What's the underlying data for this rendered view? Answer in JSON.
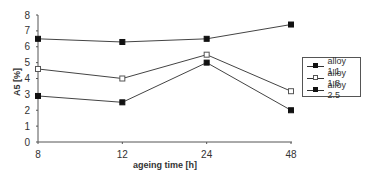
{
  "chart_data": {
    "type": "line",
    "title": "",
    "xlabel": "ageing time [h]",
    "ylabel": "A5 [%]",
    "categories": [
      "8",
      "12",
      "24",
      "48"
    ],
    "ylim": [
      0,
      8
    ],
    "yticks": [
      "0",
      "1",
      "2",
      "3",
      "4",
      "5",
      "6",
      "7",
      "8"
    ],
    "grid": false,
    "legend_position": "right",
    "series": [
      {
        "name": "alloy 1.1",
        "values": [
          6.5,
          6.3,
          6.5,
          7.4
        ],
        "marker": "filled-square",
        "color": "#111111"
      },
      {
        "name": "alloy 1.8",
        "values": [
          4.6,
          4.0,
          5.5,
          3.2
        ],
        "marker": "open-square",
        "color": "#555555"
      },
      {
        "name": "alloy 2.5",
        "values": [
          2.9,
          2.5,
          5.0,
          2.0
        ],
        "marker": "filled-square",
        "color": "#111111"
      }
    ]
  },
  "legend": {
    "items": [
      {
        "label": "alloy 1.1"
      },
      {
        "label": "alloy 1.8"
      },
      {
        "label": "alloy 2.5"
      }
    ]
  }
}
